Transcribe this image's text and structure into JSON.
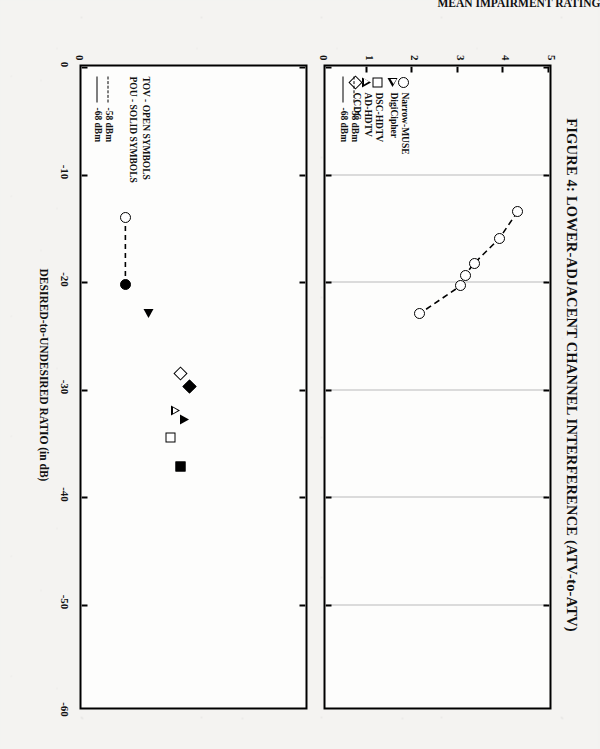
{
  "figure": {
    "title": "FIGURE 4: LOWER-ADJACENT CHANNEL INTERFERENCE (ATV-to-ATV)"
  },
  "axes": {
    "x_title": "DESIRED-to-UNDESIRED RATIO (in dB)",
    "y_title_top": "MEAN IMPAIRMENT RATING",
    "x_ticks": [
      "0",
      "-10",
      "-20",
      "-30",
      "-40",
      "-50",
      "-60"
    ],
    "y_ticks_top": [
      "0",
      "1",
      "2",
      "3",
      "4",
      "5"
    ],
    "y_ticks_bottom": [
      "0"
    ]
  },
  "legend_symbols": {
    "items": [
      {
        "label": "Narrow-MUSE",
        "symbol": "circle-open"
      },
      {
        "label": "DigiCipher",
        "symbol": "triangle-right-open"
      },
      {
        "label": "DSC-HDTV",
        "symbol": "square-open"
      },
      {
        "label": "AD-HDTV",
        "symbol": "triangle-left-open"
      },
      {
        "label": "CCDC",
        "symbol": "diamond-open"
      }
    ]
  },
  "legend_levels": {
    "items": [
      {
        "label": "-58 dBm",
        "line": "dashed"
      },
      {
        "label": "-68 dBm",
        "line": "solid"
      }
    ]
  },
  "legend_notes": {
    "lines": [
      "TOV - OPEN SYMBOLS",
      "POU - SOLID SYMBOLS"
    ]
  },
  "chart_data": [
    {
      "id": "top-panel",
      "type": "line",
      "title": "FIGURE 4: LOWER-ADJACENT CHANNEL INTERFERENCE (ATV-to-ATV)",
      "xlabel": "DESIRED-to-UNDESIRED RATIO (in dB)",
      "ylabel": "MEAN IMPAIRMENT RATING",
      "xlim": [
        0,
        -60
      ],
      "ylim": [
        0,
        5
      ],
      "xticks": [
        0,
        -10,
        -20,
        -30,
        -40,
        -50,
        -60
      ],
      "yticks": [
        0,
        1,
        2,
        3,
        4,
        5
      ],
      "grid": "vertical-dotted",
      "series": [
        {
          "name": "Narrow-MUSE  -58 dBm",
          "symbol": "circle-open",
          "line": "dashed",
          "points": [
            {
              "x": -13.5,
              "y": 4.3
            },
            {
              "x": -16.0,
              "y": 3.9
            },
            {
              "x": -18.3,
              "y": 3.35
            },
            {
              "x": -19.4,
              "y": 3.15
            },
            {
              "x": -20.4,
              "y": 3.05
            },
            {
              "x": -23.0,
              "y": 2.15
            }
          ]
        }
      ]
    },
    {
      "id": "bottom-panel",
      "type": "scatter",
      "xlabel": "DESIRED-to-UNDESIRED RATIO (in dB)",
      "ylabel": "",
      "xlim": [
        0,
        -60
      ],
      "ylim": [
        0,
        5
      ],
      "xticks": [
        0,
        -10,
        -20,
        -30,
        -40,
        -50,
        -60
      ],
      "grid": "none",
      "annotations": [
        "TOV - OPEN SYMBOLS",
        "POU - SOLID SYMBOLS"
      ],
      "series": [
        {
          "name": "Narrow-MUSE TOV -58 dBm",
          "symbol": "circle-open",
          "points": [
            {
              "x": -14.0,
              "y": 1.05
            }
          ]
        },
        {
          "name": "Narrow-MUSE POU -58 dBm",
          "symbol": "circle-solid",
          "points": [
            {
              "x": -20.3,
              "y": 1.05
            }
          ]
        },
        {
          "name": "DigiCipher POU",
          "symbol": "triangle-right-solid",
          "points": [
            {
              "x": -23.0,
              "y": 1.55
            }
          ]
        },
        {
          "name": "DSC-HDTV TOV",
          "symbol": "square-open",
          "points": [
            {
              "x": -34.5,
              "y": 2.05
            }
          ]
        },
        {
          "name": "DSC-HDTV POU",
          "symbol": "square-solid",
          "points": [
            {
              "x": -37.2,
              "y": 2.25
            }
          ]
        },
        {
          "name": "AD-HDTV TOV",
          "symbol": "triangle-left-open",
          "points": [
            {
              "x": -32.0,
              "y": 2.15
            }
          ]
        },
        {
          "name": "AD-HDTV POU",
          "symbol": "triangle-left-solid",
          "points": [
            {
              "x": -32.8,
              "y": 2.35
            }
          ]
        },
        {
          "name": "CCDC TOV",
          "symbol": "diamond-open",
          "points": [
            {
              "x": -28.6,
              "y": 2.25
            }
          ]
        },
        {
          "name": "CCDC POU",
          "symbol": "diamond-solid",
          "points": [
            {
              "x": -29.8,
              "y": 2.45
            }
          ]
        }
      ]
    }
  ]
}
